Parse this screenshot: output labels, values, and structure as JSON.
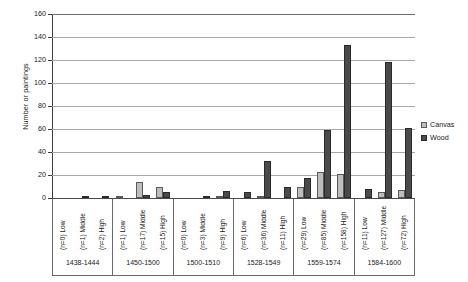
{
  "chart_data": {
    "type": "bar",
    "title": "",
    "xlabel": "",
    "ylabel": "Number or paintings",
    "ylim": [
      0,
      160
    ],
    "y_ticks": [
      0,
      20,
      40,
      60,
      80,
      100,
      120,
      140,
      160
    ],
    "grid": true,
    "legend_position": "right",
    "series": [
      {
        "name": "Canvas",
        "color": "#bdbdbd",
        "values": [
          0,
          0,
          0,
          1,
          14,
          10,
          0,
          0,
          1,
          0,
          2,
          0,
          10,
          23,
          21,
          0,
          5,
          7
        ]
      },
      {
        "name": "Wood",
        "color": "#4a4a4a",
        "values": [
          0,
          1,
          2,
          0,
          3,
          5,
          0,
          2,
          6,
          5,
          32,
          10,
          17,
          59,
          133,
          8,
          118,
          61
        ]
      }
    ],
    "categories": [
      "(n=0) Low",
      "(n=1) Middle",
      "(n=2) High",
      "(n=1) Low",
      "(n=17) Middle",
      "(n=15) High",
      "(n=0) Low",
      "(n=3) Middle",
      "(n=9) High",
      "(n=6) Low",
      "(n=36) Middle",
      "(n=11) High",
      "(n=29) Low",
      "(n=85) Middle",
      "(n=158) High",
      "(n=11) Low",
      "(n=127) Middle",
      "(n=72) High"
    ],
    "groups": [
      {
        "period": "1438-1444",
        "categories": [
          {
            "label": "(n=0) Low",
            "canvas": 0,
            "wood": 0
          },
          {
            "label": "(n=1) Middle",
            "canvas": 0,
            "wood": 1
          },
          {
            "label": "(n=2) High",
            "canvas": 0,
            "wood": 2
          }
        ]
      },
      {
        "period": "1450-1500",
        "categories": [
          {
            "label": "(n=1) Low",
            "canvas": 1,
            "wood": 0
          },
          {
            "label": "(n=17) Middle",
            "canvas": 14,
            "wood": 3
          },
          {
            "label": "(n=15) High",
            "canvas": 10,
            "wood": 5
          }
        ]
      },
      {
        "period": "1500-1510",
        "categories": [
          {
            "label": "(n=0) Low",
            "canvas": 0,
            "wood": 0
          },
          {
            "label": "(n=3) Middle",
            "canvas": 0,
            "wood": 2
          },
          {
            "label": "(n=9) High",
            "canvas": 1,
            "wood": 6
          }
        ]
      },
      {
        "period": "1528-1549",
        "categories": [
          {
            "label": "(n=6) Low",
            "canvas": 0,
            "wood": 5
          },
          {
            "label": "(n=36) Middle",
            "canvas": 2,
            "wood": 32
          },
          {
            "label": "(n=11) High",
            "canvas": 0,
            "wood": 10
          }
        ]
      },
      {
        "period": "1559-1574",
        "categories": [
          {
            "label": "(n=29) Low",
            "canvas": 10,
            "wood": 17
          },
          {
            "label": "(n=85) Middle",
            "canvas": 23,
            "wood": 59
          },
          {
            "label": "(n=158) High",
            "canvas": 21,
            "wood": 133
          }
        ]
      },
      {
        "period": "1584-1600",
        "categories": [
          {
            "label": "(n=11) Low",
            "canvas": 0,
            "wood": 8
          },
          {
            "label": "(n=127) Middle",
            "canvas": 5,
            "wood": 118
          },
          {
            "label": "(n=72) High",
            "canvas": 7,
            "wood": 61
          }
        ]
      }
    ],
    "legend": [
      {
        "label": "Canvas",
        "color": "#bdbdbd"
      },
      {
        "label": "Wood",
        "color": "#4a4a4a"
      }
    ]
  }
}
